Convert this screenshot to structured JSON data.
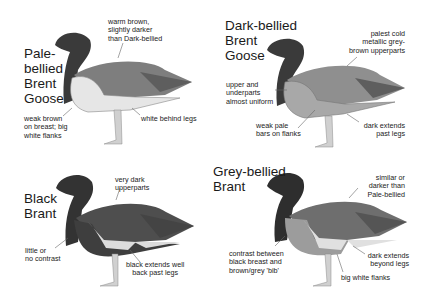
{
  "panels": [
    {
      "id": "pale-bellied",
      "title": "Pale-\nbellied\nBrent\nGoose",
      "notes": {
        "upperparts": "warm brown,\nslightly darker\nthan Dark-bellied",
        "breast": "weak brown\non breast; big\nwhite flanks",
        "rear": "white behind legs"
      },
      "colors": {
        "head": "#3a3a3a",
        "back": "#7e7e7e",
        "wing": "#5e5e5e",
        "belly": "#e6e6e6",
        "flank": "#d8d8d8"
      }
    },
    {
      "id": "dark-bellied",
      "title": "Dark-bellied\nBrent\nGoose",
      "notes": {
        "upperparts": "palest cold\nmetallic grey-\nbrown upperparts",
        "uniform": "upper and\nunderparts\nalmost uniform",
        "flanks": "weak pale\nbars on flanks",
        "rear": "dark extends\npast legs"
      },
      "colors": {
        "head": "#3a3a3a",
        "back": "#8f8f8f",
        "wing": "#5e5e5e",
        "belly": "#9a9a9a",
        "flank": "#b0b0b0"
      }
    },
    {
      "id": "black-brant",
      "title": "Black\nBrant",
      "notes": {
        "upperparts": "very dark\nupperparts",
        "contrast": "little or\nno contrast",
        "rear": "black extends well\nback past legs"
      },
      "colors": {
        "head": "#333333",
        "back": "#4e4e4e",
        "wing": "#444444",
        "belly": "#3e3e3e",
        "flank": "#dcdcdc"
      }
    },
    {
      "id": "grey-bellied",
      "title": "Grey-bellied\nBrant",
      "notes": {
        "upperparts": "similar or\ndarker than\nPale-bellied",
        "contrast": "contrast between\nblack breast and\nbrown/grey 'bib'",
        "rear": "dark extends\nbeyond legs",
        "flanks": "big white flanks"
      },
      "colors": {
        "head": "#2e2e2e",
        "back": "#6e6e6e",
        "wing": "#555555",
        "belly": "#9c9c9c",
        "flank": "#e0e0e0"
      }
    }
  ]
}
